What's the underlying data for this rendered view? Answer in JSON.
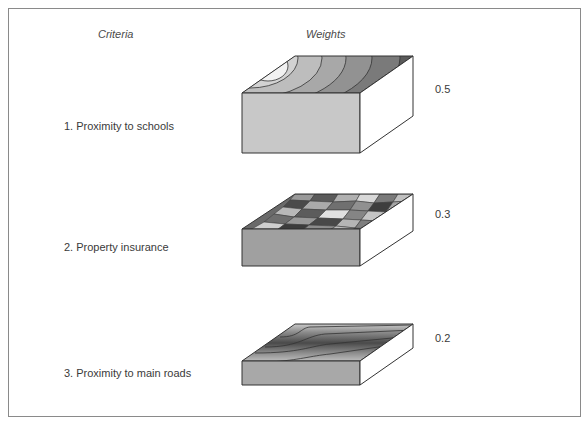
{
  "headers": {
    "criteria": "Criteria",
    "weights": "Weights"
  },
  "criteria": [
    {
      "label": "1. Proximity to schools",
      "weight": "0.5",
      "surface": "concentric-contours"
    },
    {
      "label": "2. Property insurance",
      "weight": "0.3",
      "surface": "mosaic-patches"
    },
    {
      "label": "3. Proximity to main roads",
      "weight": "0.2",
      "surface": "linear-bands"
    }
  ],
  "colors": {
    "border": "#8a8a8a",
    "front_face": "#c8c8c8",
    "front_face_dark": "#a0a0a0",
    "side_face": "#ffffff",
    "outline": "#333333"
  }
}
